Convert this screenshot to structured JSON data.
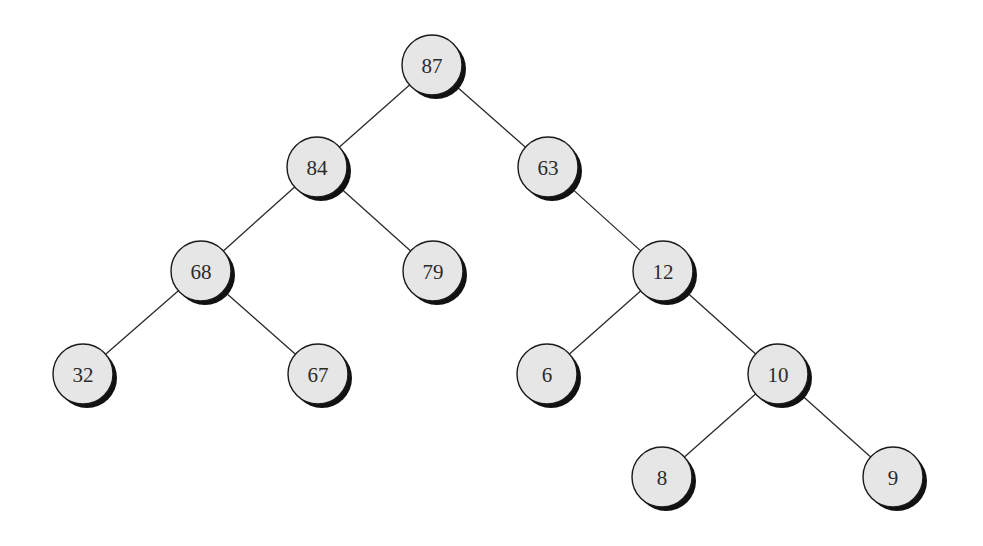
{
  "diagram": {
    "type": "binary-tree",
    "node_radius": 30,
    "colors": {
      "background": "#ffffff",
      "node_fill": "#e6e6e6",
      "node_stroke": "#1a1a1a",
      "shadow": "#111111",
      "edge": "#2a2a2a",
      "label": "#2b2b2b"
    },
    "nodes": [
      {
        "id": "n87",
        "label": "87",
        "x": 432,
        "y": 65
      },
      {
        "id": "n84",
        "label": "84",
        "x": 317,
        "y": 167
      },
      {
        "id": "n63",
        "label": "63",
        "x": 548,
        "y": 167
      },
      {
        "id": "n68",
        "label": "68",
        "x": 201,
        "y": 271
      },
      {
        "id": "n79",
        "label": "79",
        "x": 433,
        "y": 271
      },
      {
        "id": "n12",
        "label": "12",
        "x": 663,
        "y": 271
      },
      {
        "id": "n32",
        "label": "32",
        "x": 83,
        "y": 374
      },
      {
        "id": "n67",
        "label": "67",
        "x": 318,
        "y": 374
      },
      {
        "id": "n6",
        "label": "6",
        "x": 547,
        "y": 374
      },
      {
        "id": "n10",
        "label": "10",
        "x": 778,
        "y": 374
      },
      {
        "id": "n8",
        "label": "8",
        "x": 662,
        "y": 477
      },
      {
        "id": "n9",
        "label": "9",
        "x": 893,
        "y": 477
      }
    ],
    "edges": [
      {
        "from": "n87",
        "to": "n84"
      },
      {
        "from": "n87",
        "to": "n63"
      },
      {
        "from": "n84",
        "to": "n68"
      },
      {
        "from": "n84",
        "to": "n79"
      },
      {
        "from": "n63",
        "to": "n12"
      },
      {
        "from": "n68",
        "to": "n32"
      },
      {
        "from": "n68",
        "to": "n67"
      },
      {
        "from": "n12",
        "to": "n6"
      },
      {
        "from": "n12",
        "to": "n10"
      },
      {
        "from": "n10",
        "to": "n8"
      },
      {
        "from": "n10",
        "to": "n9"
      }
    ]
  }
}
